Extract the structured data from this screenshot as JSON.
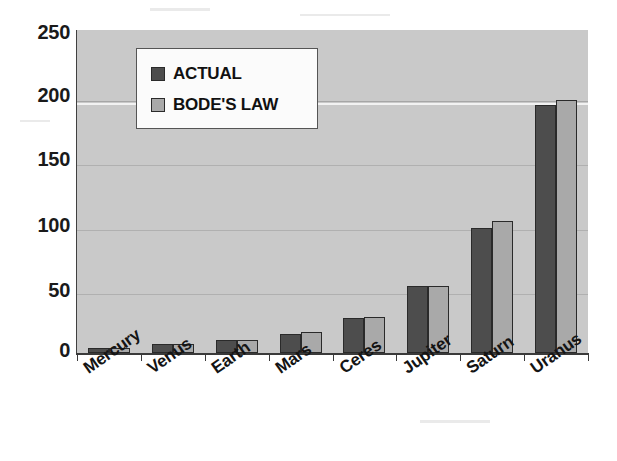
{
  "chart_data": {
    "type": "bar",
    "title": "",
    "subtitle": "",
    "xlabel": "",
    "ylabel": "",
    "categories": [
      "Mercury",
      "Venus",
      "Earth",
      "Mars",
      "Ceres",
      "Jupiter",
      "Saturn",
      "Uranus"
    ],
    "series": [
      {
        "name": "ACTUAL",
        "color": "#4d4d4d",
        "values": [
          4,
          7,
          10,
          15,
          27,
          52,
          97,
          192
        ]
      },
      {
        "name": "BODE'S LAW",
        "color": "#a9a9a9",
        "values": [
          4,
          7,
          10,
          16,
          28,
          52,
          102,
          196
        ]
      }
    ],
    "ylim": [
      0,
      250
    ],
    "yticks": [
      0,
      50,
      100,
      150,
      200,
      250
    ],
    "ytick_labels": [
      "0",
      "50",
      "100",
      "150",
      "200",
      "250"
    ],
    "grid": true,
    "grid_axis": "y",
    "legend_position": "upper-left-inside",
    "plot_background": "#c9c9c9",
    "figure_background": "#ffffff",
    "xtick_label_rotation": -35
  },
  "legend": {
    "items": [
      {
        "label": "ACTUAL",
        "swatch": "legend-swatch-actual"
      },
      {
        "label": "BODE'S LAW",
        "swatch": "legend-swatch-bode"
      }
    ]
  },
  "axes": {
    "y_tick_labels": [
      "250",
      "200",
      "150",
      "100",
      "50",
      "0"
    ],
    "x_tick_labels": [
      "Mercury",
      "Venus",
      "Earth",
      "Mars",
      "Ceres",
      "Jupiter",
      "Saturn",
      "Uranus"
    ]
  }
}
